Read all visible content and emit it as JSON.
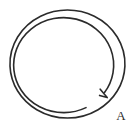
{
  "figure": {
    "background_color": "#ffffff",
    "stroke_color": "#2b2b2b",
    "canvas": {
      "width": 138,
      "height": 133
    }
  },
  "diagram": {
    "type": "split-ring-spiral",
    "outer_ring": {
      "name": "outer-ring",
      "center_x": 67.5,
      "center_y": 64.0,
      "radius_x": 57.5,
      "radius_y": 54.0,
      "stroke_width": 1.6,
      "path": "M 67.5 10 A 57.5 54 0 1 1 67.4 10 Z"
    },
    "inner_spiral": {
      "name": "inner-spiral",
      "center_x": 67.5,
      "center_y": 64.0,
      "radius_x": 50.0,
      "radius_y": 47.5,
      "stroke_width": 1.6,
      "description": "Inner coil of the split ring; starts near the lower-left, wraps around and terminates at the free end at lower right.",
      "path": "M 86 107.6 A 50 47.5 0 1 1 104.5 92.5"
    },
    "free_end": {
      "name": "spiral-free-end",
      "x": 105,
      "y": 95,
      "description": "Hooked tip where the inner coil of the split ring ends.",
      "path": "M 100.2 89.2 L 107.2 97.6 L 99.6 95.4"
    }
  },
  "labels": [
    {
      "id": "label-a",
      "text": "A",
      "x": 120,
      "y": 117,
      "font_size": 13,
      "color": "#2b2b2b",
      "refers_to": "spiral-free-end"
    }
  ]
}
